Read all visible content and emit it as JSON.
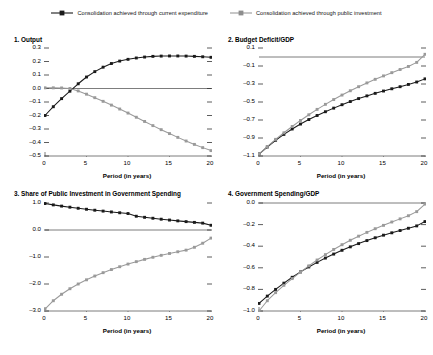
{
  "legend": {
    "entries": [
      {
        "label": "Consolidation achieved through current expenditure",
        "color": "#1a1a1a",
        "marker": "square-marker"
      },
      {
        "label": "Consolidation achieved through public investment",
        "color": "#9a9a9a",
        "marker": "square-marker"
      }
    ]
  },
  "series_colors": {
    "current_expenditure": "#1a1a1a",
    "public_investment": "#9a9a9a",
    "axis": "#6e6e6e",
    "zero_line": "#6e6e6e"
  },
  "chart_data": [
    {
      "type": "line",
      "title": "1. Output",
      "xlabel": "Period (in years)",
      "ylabel": "",
      "xlim": [
        0,
        20
      ],
      "ylim": [
        -0.5,
        0.3
      ],
      "xticks": [
        0,
        5,
        10,
        15,
        20
      ],
      "yticks": [
        -0.5,
        -0.4,
        -0.3,
        -0.2,
        -0.1,
        0.0,
        0.1,
        0.2,
        0.3
      ],
      "ytick_labels": [
        "-0.5",
        "-0.4",
        "-0.3",
        "-0.2",
        "-0.1",
        "0.0",
        "0.1",
        "0.2",
        "0.3"
      ],
      "xtick_labels": [
        "0",
        "5",
        "10",
        "15",
        "20"
      ],
      "grid": false,
      "zero_line": 0.0,
      "legend_position": "figure-top",
      "x": [
        0,
        1,
        2,
        3,
        4,
        5,
        6,
        7,
        8,
        9,
        10,
        11,
        12,
        13,
        14,
        15,
        16,
        17,
        18,
        19,
        20
      ],
      "series": [
        {
          "name": "Consolidation achieved through current expenditure",
          "color": "#1a1a1a",
          "values": [
            -0.2,
            -0.135,
            -0.075,
            -0.02,
            0.035,
            0.085,
            0.125,
            0.158,
            0.185,
            0.203,
            0.216,
            0.226,
            0.233,
            0.238,
            0.24,
            0.241,
            0.241,
            0.24,
            0.238,
            0.235,
            0.231
          ]
        },
        {
          "name": "Consolidation achieved through public investment",
          "color": "#9a9a9a",
          "values": [
            0.005,
            0.005,
            0.004,
            0.0,
            -0.018,
            -0.042,
            -0.068,
            -0.095,
            -0.123,
            -0.152,
            -0.182,
            -0.213,
            -0.244,
            -0.275,
            -0.305,
            -0.334,
            -0.362,
            -0.389,
            -0.414,
            -0.438,
            -0.46
          ]
        }
      ]
    },
    {
      "type": "line",
      "title": "2. Budget Deficit/GDP",
      "xlabel": "Period (in years)",
      "ylabel": "",
      "xlim": [
        0,
        20
      ],
      "ylim": [
        -1.1,
        0.1
      ],
      "xticks": [
        0,
        5,
        10,
        15,
        20
      ],
      "yticks": [
        -1.1,
        -0.9,
        -0.7,
        -0.5,
        -0.3,
        -0.1,
        0.1
      ],
      "ytick_labels": [
        "-1.1",
        "-0.9",
        "-0.7",
        "-0.5",
        "-0.3",
        "-0.1",
        "0.1"
      ],
      "xtick_labels": [
        "0",
        "5",
        "10",
        "15",
        "20"
      ],
      "grid": false,
      "zero_line": 0.0,
      "legend_position": "figure-top",
      "x": [
        0,
        1,
        2,
        3,
        4,
        5,
        6,
        7,
        8,
        9,
        10,
        11,
        12,
        13,
        14,
        15,
        16,
        17,
        18,
        19,
        20
      ],
      "series": [
        {
          "name": "Consolidation achieved through current expenditure",
          "color": "#1a1a1a",
          "values": [
            -1.08,
            -1.0,
            -0.925,
            -0.86,
            -0.8,
            -0.745,
            -0.695,
            -0.65,
            -0.608,
            -0.568,
            -0.53,
            -0.495,
            -0.462,
            -0.432,
            -0.404,
            -0.378,
            -0.353,
            -0.33,
            -0.305,
            -0.278,
            -0.243
          ]
        },
        {
          "name": "Consolidation achieved through public investment",
          "color": "#9a9a9a",
          "values": [
            -1.08,
            -0.995,
            -0.915,
            -0.842,
            -0.772,
            -0.705,
            -0.642,
            -0.582,
            -0.526,
            -0.473,
            -0.423,
            -0.375,
            -0.33,
            -0.288,
            -0.248,
            -0.21,
            -0.174,
            -0.139,
            -0.105,
            -0.06,
            0.03
          ]
        }
      ]
    },
    {
      "type": "line",
      "title": "3. Share of Public Investment in Government Spending",
      "xlabel": "Period (in years)",
      "ylabel": "",
      "xlim": [
        0,
        20
      ],
      "ylim": [
        -3.0,
        1.0
      ],
      "xticks": [
        0,
        5,
        10,
        15,
        20
      ],
      "yticks": [
        -3.0,
        -2.0,
        -1.0,
        0.0,
        1.0
      ],
      "ytick_labels": [
        "-3.0",
        "-2.0",
        "-1.0",
        "0.0",
        "1.0"
      ],
      "xtick_labels": [
        "0",
        "5",
        "10",
        "15",
        "20"
      ],
      "grid": false,
      "zero_line": 0.0,
      "legend_position": "figure-top",
      "x": [
        0,
        1,
        2,
        3,
        4,
        5,
        6,
        7,
        8,
        9,
        10,
        11,
        12,
        13,
        14,
        15,
        16,
        17,
        18,
        19,
        20
      ],
      "series": [
        {
          "name": "Consolidation achieved through current expenditure",
          "color": "#1a1a1a",
          "values": [
            0.98,
            0.93,
            0.885,
            0.845,
            0.805,
            0.768,
            0.733,
            0.7,
            0.668,
            0.638,
            0.61,
            0.51,
            0.47,
            0.435,
            0.4,
            0.368,
            0.338,
            0.31,
            0.282,
            0.255,
            0.175
          ]
        },
        {
          "name": "Consolidation achieved through public investment",
          "color": "#9a9a9a",
          "values": [
            -2.93,
            -2.62,
            -2.38,
            -2.175,
            -2.0,
            -1.845,
            -1.705,
            -1.58,
            -1.465,
            -1.36,
            -1.262,
            -1.172,
            -1.088,
            -1.01,
            -0.938,
            -0.87,
            -0.806,
            -0.746,
            -0.64,
            -0.49,
            -0.3
          ]
        }
      ]
    },
    {
      "type": "line",
      "title": "4. Government Spending/GDP",
      "xlabel": "Period (in years)",
      "ylabel": "",
      "xlim": [
        0,
        20
      ],
      "ylim": [
        -1.0,
        0.0
      ],
      "xticks": [
        0,
        5,
        10,
        15,
        20
      ],
      "yticks": [
        -1.0,
        -0.8,
        -0.6,
        -0.4,
        -0.2,
        0.0
      ],
      "ytick_labels": [
        "-1.0",
        "-0.8",
        "-0.6",
        "-0.4",
        "-0.2",
        "0.0"
      ],
      "xtick_labels": [
        "0",
        "5",
        "10",
        "15",
        "20"
      ],
      "grid": false,
      "zero_line": 0.0,
      "legend_position": "figure-top",
      "x": [
        0,
        1,
        2,
        3,
        4,
        5,
        6,
        7,
        8,
        9,
        10,
        11,
        12,
        13,
        14,
        15,
        16,
        17,
        18,
        19,
        20
      ],
      "series": [
        {
          "name": "Consolidation achieved through current expenditure",
          "color": "#1a1a1a",
          "values": [
            -0.93,
            -0.862,
            -0.8,
            -0.742,
            -0.688,
            -0.638,
            -0.592,
            -0.55,
            -0.51,
            -0.473,
            -0.438,
            -0.406,
            -0.376,
            -0.348,
            -0.322,
            -0.298,
            -0.276,
            -0.255,
            -0.234,
            -0.212,
            -0.172
          ]
        },
        {
          "name": "Consolidation achieved through public investment",
          "color": "#9a9a9a",
          "values": [
            -1.0,
            -0.905,
            -0.83,
            -0.762,
            -0.7,
            -0.64,
            -0.582,
            -0.528,
            -0.478,
            -0.43,
            -0.386,
            -0.345,
            -0.307,
            -0.272,
            -0.238,
            -0.207,
            -0.176,
            -0.147,
            -0.118,
            -0.08,
            -0.01
          ]
        }
      ]
    }
  ]
}
